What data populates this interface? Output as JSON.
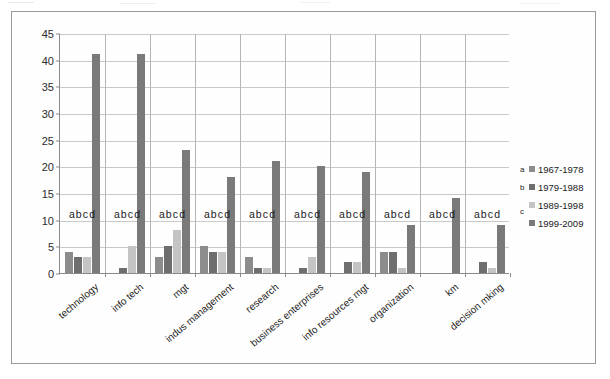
{
  "chart_data": {
    "type": "bar",
    "title": "",
    "xlabel": "",
    "ylabel": "",
    "ylim": [
      0,
      45
    ],
    "ytick_step": 5,
    "yticks": [
      0,
      5,
      10,
      15,
      20,
      25,
      30,
      35,
      40,
      45
    ],
    "grid": true,
    "legend_position": "right",
    "group_point_labels": "abcd",
    "categories": [
      "technology",
      "info tech",
      "mgt",
      "indus management",
      "research",
      "business enterprises",
      "info resources mgt",
      "organization",
      "km",
      "decision mking"
    ],
    "series": [
      {
        "key": "a",
        "name": "1967-1978",
        "color": "#8c8c8c",
        "values": [
          4,
          0,
          3,
          5,
          3,
          0,
          0,
          4,
          0,
          0
        ]
      },
      {
        "key": "b",
        "name": "1979-1988",
        "color": "#6e6e6e",
        "values": [
          3,
          1,
          5,
          4,
          1,
          1,
          2,
          4,
          0,
          2
        ]
      },
      {
        "key": "c",
        "name": "1989-1998",
        "color": "#c4c4c4",
        "values": [
          3,
          5,
          8,
          4,
          1,
          3,
          2,
          1,
          0,
          1
        ]
      },
      {
        "key": "d",
        "name": "1999-2009",
        "color": "#7a7a7a",
        "values": [
          41,
          41,
          23,
          18,
          21,
          20,
          19,
          9,
          14,
          9
        ]
      }
    ]
  },
  "legend": {
    "rows": [
      {
        "key": "a",
        "label": "1967-1978"
      },
      {
        "key": "b",
        "label": "1979-1988"
      },
      {
        "key": "c",
        "label": "1989-1998"
      },
      {
        "key": "",
        "label": "1999-2009"
      }
    ],
    "c_key_standalone": "c"
  }
}
